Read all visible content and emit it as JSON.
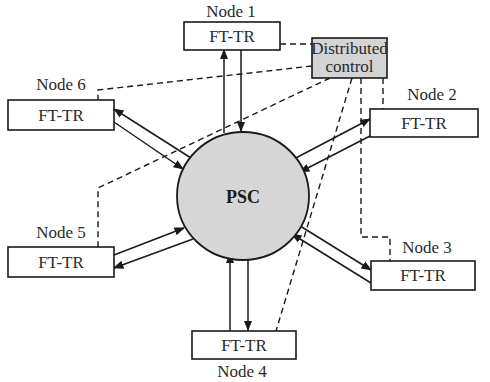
{
  "diagram": {
    "type": "star-network",
    "hub": {
      "label": "PSC",
      "fill": "#d6d6d6"
    },
    "controller": {
      "line1": "Distributed",
      "line2": "control",
      "fill": "#d4d4d4"
    },
    "nodes": [
      {
        "id": "node1",
        "name": "Node 1",
        "box_label": "FT-TR"
      },
      {
        "id": "node2",
        "name": "Node 2",
        "box_label": "FT-TR"
      },
      {
        "id": "node3",
        "name": "Node 3",
        "box_label": "FT-TR"
      },
      {
        "id": "node4",
        "name": "Node 4",
        "box_label": "FT-TR"
      },
      {
        "id": "node5",
        "name": "Node 5",
        "box_label": "FT-TR"
      },
      {
        "id": "node6",
        "name": "Node 6",
        "box_label": "FT-TR"
      }
    ],
    "edges": {
      "data_links": "bidirectional pair of arrows between each FT-TR and PSC",
      "control_links": "dashed lines from Distributed control to each node"
    }
  }
}
